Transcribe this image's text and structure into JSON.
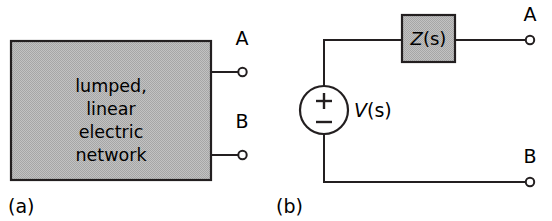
{
  "figure": {
    "background_color": "#ffffff",
    "line_color": "#231f20",
    "shade_color": "#b3b3b3",
    "panels": [
      {
        "id": "a",
        "caption": "(a)",
        "block": {
          "name": "lumped-linear-electric-network-block",
          "fill": "#b3b3b3",
          "text_lines": [
            "lumped,",
            "linear",
            "electric",
            "network"
          ]
        },
        "terminals": [
          {
            "label": "A",
            "position": "upper-right"
          },
          {
            "label": "B",
            "position": "lower-right"
          }
        ]
      },
      {
        "id": "b",
        "caption": "(b)",
        "source": {
          "name": "voltage-source",
          "label": "V(s)",
          "label_symbol": "V",
          "label_arg": "(s)",
          "plus_sign": "+",
          "minus_sign": "−"
        },
        "impedance": {
          "name": "impedance-block",
          "label": "Z(s)",
          "label_symbol": "Z",
          "label_arg": "(s)",
          "fill": "#b3b3b3"
        },
        "terminals": [
          {
            "label": "A",
            "position": "upper-right"
          },
          {
            "label": "B",
            "position": "lower-right"
          }
        ]
      }
    ]
  }
}
